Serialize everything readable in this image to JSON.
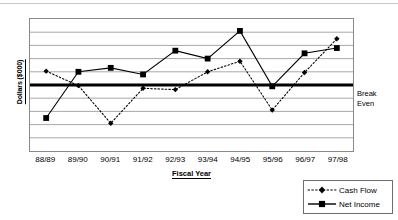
{
  "chart_data": {
    "type": "line",
    "title": "",
    "xlabel": "Fiscal Year",
    "ylabel": "Dollars ($000)",
    "categories": [
      "88/89",
      "89/90",
      "90/91",
      "91/92",
      "92/93",
      "93/94",
      "94/95",
      "95/96",
      "96/97",
      "97/98"
    ],
    "series": [
      {
        "name": "Cash Flow",
        "style": "dotted",
        "marker": "diamond",
        "color": "#000000",
        "values": [
          1.05,
          -0.05,
          -2.9,
          -0.25,
          -0.35,
          1.0,
          1.8,
          -1.9,
          0.95,
          3.5
        ]
      },
      {
        "name": "Net Income",
        "style": "solid",
        "marker": "square",
        "color": "#000000",
        "values": [
          -2.5,
          1.0,
          1.3,
          0.8,
          2.6,
          2.0,
          4.1,
          -0.1,
          2.4,
          2.8
        ]
      }
    ],
    "ylim": [
      -5,
      5
    ],
    "y_gridline_values": [
      5,
      4,
      3,
      2,
      1,
      0,
      -1,
      -2,
      -3,
      -4,
      -5
    ],
    "y_tick_labels_shown": false,
    "grid": true,
    "legend_position": "bottom-right",
    "annotations": [
      {
        "name": "break-even",
        "text_line1": "Break",
        "text_line2": "Even",
        "value": 0,
        "style": "thick-horizontal-rule"
      }
    ]
  },
  "legend": {
    "items": [
      {
        "label": "Cash Flow"
      },
      {
        "label": "Net Income"
      }
    ]
  },
  "annotation": {
    "break_even_line1": "Break",
    "break_even_line2": "Even"
  },
  "colors": {
    "ink": "#000000",
    "grid": "#a8a8a8",
    "frame": "#8a8a8a"
  }
}
